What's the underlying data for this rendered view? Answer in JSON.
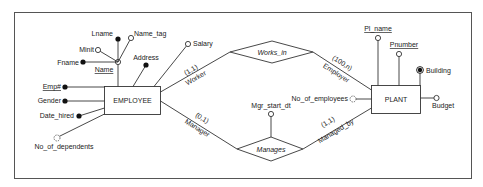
{
  "diagram": {
    "type": "ER diagram",
    "entities": [
      {
        "name": "EMPLOYEE"
      },
      {
        "name": "PLANT"
      }
    ],
    "relationships": [
      {
        "name": "Works_in",
        "roles": [
          {
            "role": "Worker",
            "cardinality": "(1,1)",
            "entity": "EMPLOYEE"
          },
          {
            "role": "Employer",
            "cardinality": "(100,n)",
            "entity": "PLANT"
          }
        ]
      },
      {
        "name": "Manages",
        "attribute": "Mgr_start_dt",
        "roles": [
          {
            "role": "Manager",
            "cardinality": "(0,1)",
            "entity": "EMPLOYEE"
          },
          {
            "role": "Managed_by",
            "cardinality": "(1,1)",
            "entity": "PLANT"
          }
        ]
      }
    ],
    "employee_attributes": {
      "lname": "Lname",
      "name_tag": "Name_tag",
      "minit": "Minit",
      "fname": "Fname",
      "name": "Name",
      "address": "Address",
      "salary": "Salary",
      "empno": "Emp#",
      "gender": "Gender",
      "date_hired": "Date_hired",
      "no_of_dependents": "No_of_dependents"
    },
    "plant_attributes": {
      "pl_name": "Pl_name",
      "pnumber": "Pnumber",
      "building": "Building",
      "budget": "Budget",
      "no_of_employees": "No_of_employees"
    },
    "labels": {
      "employee": "EMPLOYEE",
      "plant": "PLANT",
      "works_in": "Works_in",
      "manages": "Manages",
      "worker": "Worker",
      "worker_card": "(1,1)",
      "employer": "Employer",
      "employer_card": "(100,n)",
      "manager": "Manager",
      "manager_card": "(0,1)",
      "managed_by": "Managed_by",
      "managed_by_card": "(1,1)",
      "mgr_start_dt": "Mgr_start_dt"
    }
  }
}
